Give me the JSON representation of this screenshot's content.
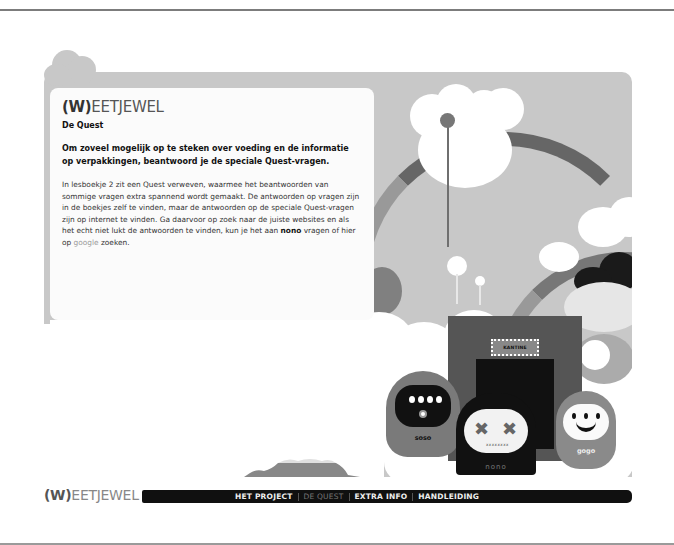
{
  "brand": {
    "logo_prefix": "(W)",
    "logo_rest": "EETJEWEL"
  },
  "content": {
    "subtitle": "De Quest",
    "lead": "Om zoveel mogelijk op te steken over voeding en de informatie op verpakkingen, beantwoord je de speciale Quest-vragen.",
    "body_part1": "In lesboekje 2 zit een Quest verweven, waarmee het beantwoorden van sommige vragen extra spannend wordt gemaakt. De antwoorden op vragen zijn in de boekjes zelf te vinden, maar de antwoorden op de speciale Quest-vragen zijn op internet te vinden. Ga daarvoor op zoek naar de juiste websites en als het echt niet lukt de antwoorden te vinden, kun je het aan ",
    "body_bold": "nono",
    "body_part2": " vragen of hier op ",
    "body_link": "google",
    "body_part3": " zoeken."
  },
  "illustration": {
    "sign_text": "KANTINE",
    "characters": [
      {
        "name": "soso"
      },
      {
        "name": "nono"
      },
      {
        "name": "gogo"
      }
    ]
  },
  "nav": {
    "items": [
      {
        "label": "HET PROJECT",
        "active": false
      },
      {
        "label": "DE QUEST",
        "active": true
      },
      {
        "label": "EXTRA INFO",
        "active": false
      },
      {
        "label": "HANDLEIDING",
        "active": false
      }
    ]
  },
  "colors": {
    "navbar": "#101010",
    "sky": "#c8c8c8",
    "card": "#fbfbfb"
  }
}
